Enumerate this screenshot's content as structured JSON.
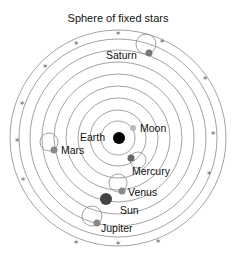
{
  "title": "Sphere of fixed stars",
  "center": {
    "x": 118,
    "y": 138
  },
  "orbit_radii": [
    17,
    28,
    40,
    52,
    64,
    76,
    88,
    99,
    108
  ],
  "bodies": [
    {
      "name": "Earth",
      "label": "Earth",
      "x": 119,
      "y": 138,
      "r": 6,
      "color": "#000000",
      "label_x": 80,
      "label_y": 137
    },
    {
      "name": "Moon",
      "label": "Moon",
      "x": 133,
      "y": 128,
      "r": 3,
      "color": "#bbbbbb",
      "label_x": 140,
      "label_y": 128
    },
    {
      "name": "Mercury",
      "label": "Mercury",
      "x": 131,
      "y": 158,
      "r": 3.5,
      "color": "#666666",
      "label_x": 132,
      "label_y": 171,
      "epicycle": {
        "x": 138,
        "y": 160,
        "r": 8
      }
    },
    {
      "name": "Venus",
      "label": "Venus",
      "x": 122,
      "y": 191,
      "r": 3.5,
      "color": "#888888",
      "label_x": 128,
      "label_y": 192,
      "epicycle": {
        "x": 118,
        "y": 183,
        "r": 9
      }
    },
    {
      "name": "Sun",
      "label": "Sun",
      "x": 106,
      "y": 199,
      "r": 6,
      "color": "#444444",
      "label_x": 120,
      "label_y": 210
    },
    {
      "name": "Mars",
      "label": "Mars",
      "x": 54,
      "y": 150,
      "r": 3.5,
      "color": "#888888",
      "label_x": 61,
      "label_y": 150,
      "epicycle": {
        "x": 49,
        "y": 142,
        "r": 9
      }
    },
    {
      "name": "Jupiter",
      "label": "Jupiter",
      "x": 97,
      "y": 223,
      "r": 3.5,
      "color": "#888888",
      "label_x": 101,
      "label_y": 228,
      "epicycle": {
        "x": 92,
        "y": 216,
        "r": 10
      }
    },
    {
      "name": "Saturn",
      "label": "Saturn",
      "x": 149,
      "y": 53,
      "r": 3.5,
      "color": "#777777",
      "label_x": 106,
      "label_y": 55,
      "epicycle": {
        "x": 146,
        "y": 44,
        "r": 10
      }
    }
  ],
  "stars": [
    {
      "x": 118,
      "y": 33
    },
    {
      "x": 76,
      "y": 43
    },
    {
      "x": 162,
      "y": 41
    },
    {
      "x": 45,
      "y": 66
    },
    {
      "x": 22,
      "y": 103
    },
    {
      "x": 17,
      "y": 140
    },
    {
      "x": 23,
      "y": 179
    },
    {
      "x": 213,
      "y": 133
    },
    {
      "x": 209,
      "y": 173
    },
    {
      "x": 76,
      "y": 242
    },
    {
      "x": 118,
      "y": 243
    },
    {
      "x": 158,
      "y": 241
    },
    {
      "x": 205,
      "y": 78
    }
  ]
}
